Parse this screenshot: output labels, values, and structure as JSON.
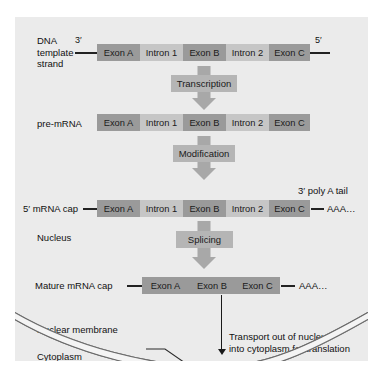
{
  "diagram": {
    "colors": {
      "panel_background": "#ebebeb",
      "exon_fill": "#9a9a9a",
      "intron_fill": "#c6c6c6",
      "arrow_fill": "#a8a8a8",
      "process_box_fill": "#b5b5b5",
      "text": "#111111",
      "membrane_line": "#555555"
    },
    "rows": {
      "dna": {
        "label_lines": [
          "DNA",
          "template",
          "strand"
        ],
        "end_left": "3′",
        "end_right": "5′",
        "segments": [
          {
            "label": "Exon A",
            "type": "exon"
          },
          {
            "label": "Intron 1",
            "type": "intron"
          },
          {
            "label": "Exon B",
            "type": "exon"
          },
          {
            "label": "Intron 2",
            "type": "intron"
          },
          {
            "label": "Exon C",
            "type": "exon"
          }
        ]
      },
      "pre_mrna": {
        "label": "pre-mRNA",
        "segments": [
          {
            "label": "Exon A",
            "type": "exon"
          },
          {
            "label": "Intron 1",
            "type": "intron"
          },
          {
            "label": "Exon B",
            "type": "exon"
          },
          {
            "label": "Intron 2",
            "type": "intron"
          },
          {
            "label": "Exon C",
            "type": "exon"
          }
        ]
      },
      "capped_mrna": {
        "label": "5′ mRNA cap",
        "tail_note": "3′ poly A tail",
        "tail": "AAA…",
        "segments": [
          {
            "label": "Exon A",
            "type": "exon"
          },
          {
            "label": "Intron 1",
            "type": "intron"
          },
          {
            "label": "Exon B",
            "type": "exon"
          },
          {
            "label": "Intron 2",
            "type": "intron"
          },
          {
            "label": "Exon C",
            "type": "exon"
          }
        ]
      },
      "mature_mrna": {
        "label": "Mature mRNA cap",
        "tail": "AAA…",
        "segments": [
          {
            "label": "Exon A",
            "type": "exon"
          },
          {
            "label": "Exon B",
            "type": "exon"
          },
          {
            "label": "Exon C",
            "type": "exon"
          }
        ]
      }
    },
    "processes": [
      {
        "label": "Transcription"
      },
      {
        "label": "Modification"
      },
      {
        "label": "Splicing"
      }
    ],
    "compartments": {
      "nucleus": "Nucleus",
      "nuclear_membrane": "Nuclear membrane",
      "cytoplasm": "Cytoplasm"
    },
    "transport_note_lines": [
      "Transport out of nucleus",
      "into cytoplasm for translation"
    ]
  }
}
